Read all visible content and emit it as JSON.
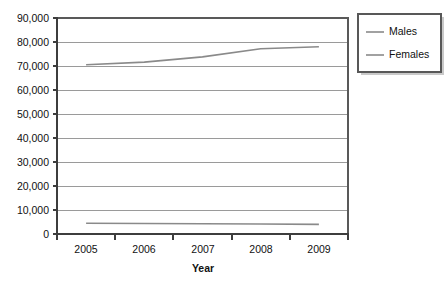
{
  "chart_data": {
    "type": "line",
    "title": "",
    "xlabel": "Year",
    "ylabel": "",
    "categories": [
      "2005",
      "2006",
      "2007",
      "2008",
      "2009"
    ],
    "series": [
      {
        "name": "Males",
        "values": [
          70500,
          71600,
          73800,
          77200,
          78000
        ]
      },
      {
        "name": "Females",
        "values": [
          4500,
          4400,
          4300,
          4150,
          4000
        ]
      }
    ],
    "ylim": [
      0,
      90000
    ],
    "ytick_labels": [
      "90,000",
      "80,000",
      "70,000",
      "60,000",
      "50,000",
      "40,000",
      "30,000",
      "20,000",
      "10,000",
      "0"
    ],
    "ytick_values": [
      90000,
      80000,
      70000,
      60000,
      50000,
      40000,
      30000,
      20000,
      10000,
      0
    ],
    "grid": "horizontal",
    "legend_position": "top-right",
    "legend_entries": [
      "Males",
      "Females"
    ],
    "series_color": "#8a8a8a",
    "gridline_color": "#9a9a9a",
    "axis_color": "#3d3d3d",
    "background_color": "#ffffff"
  }
}
